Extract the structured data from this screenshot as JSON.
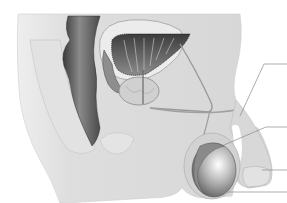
{
  "figure": {
    "style": "grayscale-illustration",
    "colors": {
      "background": "#ffffff",
      "body_fill": "#dcdcdc",
      "body_light": "#e6e6e6",
      "rectum": "#6e6e6e",
      "bladder": "#4a4a4a",
      "prostate": "#c8c8c8",
      "testis": "#9a9a9a",
      "leader_line": "#8a8a8a"
    },
    "leader_lines": [
      {
        "id": "line-1",
        "label": "",
        "y": 64
      },
      {
        "id": "line-2",
        "label": "",
        "y": 127
      },
      {
        "id": "line-3",
        "label": "",
        "y": 170
      },
      {
        "id": "line-4",
        "label": "",
        "y": 192
      }
    ]
  }
}
